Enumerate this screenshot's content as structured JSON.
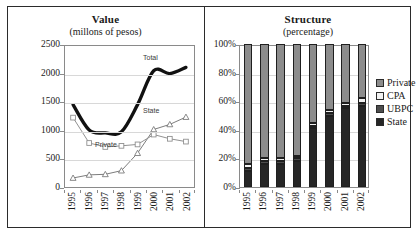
{
  "figure": {
    "panels": [
      {
        "title": "Value",
        "subtitle": "(millons of pesos)"
      },
      {
        "title": "Structure",
        "subtitle": "(percentage)"
      }
    ]
  },
  "legend": {
    "items": [
      {
        "label": "Private",
        "color": "#8c8c8c"
      },
      {
        "label": "CPA",
        "color": "#f2f2f2"
      },
      {
        "label": "UBPC",
        "color": "#4d4d4d"
      },
      {
        "label": "State",
        "color": "#262626"
      }
    ]
  },
  "chart_data": [
    {
      "type": "line",
      "title": "Value",
      "subtitle": "(millons of pesos)",
      "xlabel": "",
      "ylabel": "millons of pesos",
      "categories": [
        "1995",
        "1996",
        "1997",
        "1998",
        "1999",
        "2000",
        "2001",
        "2002"
      ],
      "ylim": [
        0,
        2500
      ],
      "yticks": [
        0,
        500,
        1000,
        1500,
        2000,
        2500
      ],
      "grid": true,
      "legend_position": "inline-annotations",
      "series": [
        {
          "name": "Total",
          "values": [
            1460,
            1010,
            960,
            980,
            1460,
            2060,
            2010,
            2120
          ],
          "style": "thick-black-smooth",
          "marker": "none",
          "color": "#111111",
          "label_x": "2000",
          "annotation": "Total"
        },
        {
          "name": "State",
          "values": [
            160,
            215,
            225,
            290,
            600,
            1020,
            1110,
            1240
          ],
          "style": "line-with-markers",
          "marker": "triangle",
          "color": "#7a7a7a",
          "annotation": "State"
        },
        {
          "name": "Private",
          "values": [
            1230,
            780,
            710,
            730,
            755,
            930,
            855,
            805
          ],
          "style": "line-with-markers",
          "marker": "square",
          "color": "#8f8f8f",
          "annotation": "Private"
        }
      ]
    },
    {
      "type": "bar",
      "stacked": true,
      "normalized": true,
      "title": "Structure",
      "subtitle": "(percentage)",
      "xlabel": "",
      "ylabel": "percentage",
      "categories": [
        "1995",
        "1996",
        "1997",
        "1998",
        "1999",
        "2000",
        "2001",
        "2002"
      ],
      "ylim": [
        0,
        100
      ],
      "yticks": [
        0,
        20,
        40,
        60,
        80,
        100
      ],
      "ytick_labels": [
        "0%",
        "20%",
        "40%",
        "60%",
        "80%",
        "100%"
      ],
      "grid": true,
      "legend_position": "right",
      "series": [
        {
          "name": "State",
          "color": "#262626",
          "values": [
            11,
            16,
            16,
            18,
            41,
            50,
            55,
            57
          ]
        },
        {
          "name": "UBPC",
          "color": "#4d4d4d",
          "values": [
            2,
            2,
            2,
            2,
            2,
            2,
            2,
            2
          ]
        },
        {
          "name": "CPA",
          "color": "#f2f2f2",
          "values": [
            3,
            2,
            2,
            2,
            2,
            2,
            2,
            3
          ]
        },
        {
          "name": "Private",
          "color": "#8c8c8c",
          "values": [
            84,
            80,
            80,
            78,
            55,
            46,
            41,
            38
          ]
        }
      ]
    }
  ]
}
